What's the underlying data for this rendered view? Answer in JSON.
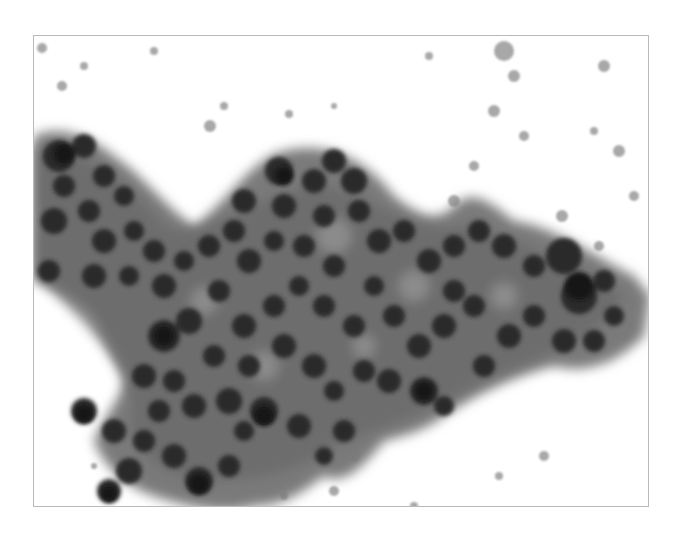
{
  "image": {
    "subject": "cytology micrograph: cohesive cluster of cells with dark round nuclei",
    "rendering": "grayscale",
    "frame": {
      "x": 33,
      "y": 35,
      "width": 616,
      "height": 472,
      "border_color": "#b9b9b9"
    },
    "colors": {
      "background": "#ffffff",
      "cytoplasm": "#6e6e6e",
      "cytoplasm_light": "#9a9a9a",
      "nucleus": "#262626",
      "nucleus_dark": "#111111",
      "debris": "#9c9c9c"
    }
  }
}
